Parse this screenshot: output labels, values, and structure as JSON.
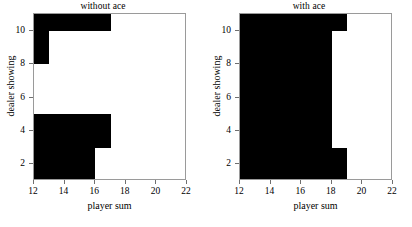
{
  "figure": {
    "width": 412,
    "height": 227,
    "background": "#ffffff",
    "fill_color": "#000000",
    "frame_color": "#9a9a9a"
  },
  "chart_data": [
    {
      "type": "heatmap",
      "title": "without ace",
      "xlabel": "player sum",
      "ylabel": "dealer showing",
      "xlim": [
        12,
        22
      ],
      "ylim": [
        1,
        11
      ],
      "xticks": [
        12,
        14,
        16,
        18,
        20,
        22
      ],
      "yticks": [
        2,
        4,
        6,
        8,
        10
      ],
      "grid": false,
      "legend": "none",
      "value_colors": {
        "1": "#000000",
        "0": "#ffffff"
      },
      "description": "Binary policy map: black = hit region, white = stick region",
      "regions": [
        {
          "x0": 12,
          "x1": 17,
          "y0": 10,
          "y1": 11,
          "value": 1
        },
        {
          "x0": 12,
          "x1": 13,
          "y0": 8,
          "y1": 10,
          "value": 1
        },
        {
          "x0": 12,
          "x1": 17,
          "y0": 3,
          "y1": 5,
          "value": 1
        },
        {
          "x0": 12,
          "x1": 16,
          "y0": 1,
          "y1": 3,
          "value": 1
        }
      ]
    },
    {
      "type": "heatmap",
      "title": "with ace",
      "xlabel": "player sum",
      "ylabel": "dealer showing",
      "xlim": [
        12,
        22
      ],
      "ylim": [
        1,
        11
      ],
      "xticks": [
        12,
        14,
        16,
        18,
        20,
        22
      ],
      "yticks": [
        2,
        4,
        6,
        8,
        10
      ],
      "grid": false,
      "legend": "none",
      "value_colors": {
        "1": "#000000",
        "0": "#ffffff"
      },
      "description": "Binary policy map: black = hit region, white = stick region",
      "regions": [
        {
          "x0": 12,
          "x1": 19,
          "y0": 10,
          "y1": 11,
          "value": 1
        },
        {
          "x0": 12,
          "x1": 18,
          "y0": 3,
          "y1": 10,
          "value": 1
        },
        {
          "x0": 12,
          "x1": 19,
          "y0": 1,
          "y1": 3,
          "value": 1
        }
      ]
    }
  ]
}
